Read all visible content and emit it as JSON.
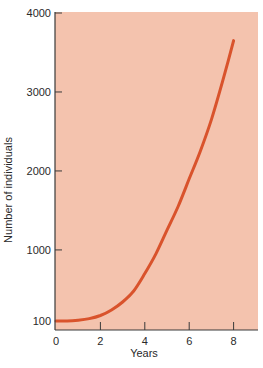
{
  "chart_data": {
    "type": "line",
    "title": "",
    "xlabel": "Years",
    "ylabel": "Number of individuals",
    "xlim": [
      0,
      9
    ],
    "ylim": [
      0,
      4000
    ],
    "x_ticks": [
      0,
      2,
      4,
      6,
      8
    ],
    "x_tick_labels": [
      "0",
      "2",
      "4",
      "6",
      "8"
    ],
    "y_ticks": [
      100,
      1000,
      2000,
      3000,
      4000
    ],
    "y_tick_labels": [
      "100",
      "1000",
      "2000",
      "3000",
      "4000"
    ],
    "grid": false,
    "legend": null,
    "series": [
      {
        "name": "Population growth",
        "x": [
          0,
          0.5,
          1,
          1.5,
          2,
          2.5,
          3,
          3.5,
          4,
          4.5,
          5,
          5.5,
          6,
          6.5,
          7,
          7.5,
          8
        ],
        "values": [
          100,
          100,
          110,
          130,
          170,
          240,
          340,
          480,
          700,
          950,
          1250,
          1550,
          1900,
          2250,
          2650,
          3130,
          3650
        ]
      }
    ],
    "colors": {
      "plot_background": "#f4c3ae",
      "line": "#d9532c",
      "axis": "#3a3a3a"
    }
  }
}
